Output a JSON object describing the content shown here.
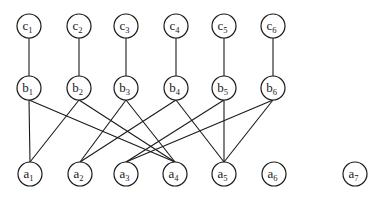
{
  "diagram": {
    "type": "layered-graph",
    "node_radius": 12,
    "colors": {
      "stroke": "#1a1a1a",
      "fill": "#ffffff",
      "background": "#ffffff"
    },
    "nodes": [
      {
        "id": "c1",
        "base": "c",
        "sub": "1",
        "x": 29,
        "y": 26
      },
      {
        "id": "c2",
        "base": "c",
        "sub": "2",
        "x": 79,
        "y": 26
      },
      {
        "id": "c3",
        "base": "c",
        "sub": "3",
        "x": 126,
        "y": 26
      },
      {
        "id": "c4",
        "base": "c",
        "sub": "4",
        "x": 176,
        "y": 26
      },
      {
        "id": "c5",
        "base": "c",
        "sub": "5",
        "x": 224,
        "y": 26
      },
      {
        "id": "c6",
        "base": "c",
        "sub": "6",
        "x": 273,
        "y": 26
      },
      {
        "id": "b1",
        "base": "b",
        "sub": "1",
        "x": 29,
        "y": 88
      },
      {
        "id": "b2",
        "base": "b",
        "sub": "2",
        "x": 79,
        "y": 88
      },
      {
        "id": "b3",
        "base": "b",
        "sub": "3",
        "x": 126,
        "y": 88
      },
      {
        "id": "b4",
        "base": "b",
        "sub": "4",
        "x": 176,
        "y": 88
      },
      {
        "id": "b5",
        "base": "b",
        "sub": "5",
        "x": 224,
        "y": 88
      },
      {
        "id": "b6",
        "base": "b",
        "sub": "6",
        "x": 273,
        "y": 88
      },
      {
        "id": "a1",
        "base": "a",
        "sub": "1",
        "x": 30,
        "y": 174
      },
      {
        "id": "a2",
        "base": "a",
        "sub": "2",
        "x": 80,
        "y": 174
      },
      {
        "id": "a3",
        "base": "a",
        "sub": "3",
        "x": 126,
        "y": 174
      },
      {
        "id": "a4",
        "base": "a",
        "sub": "4",
        "x": 175,
        "y": 174
      },
      {
        "id": "a5",
        "base": "a",
        "sub": "5",
        "x": 224,
        "y": 174
      },
      {
        "id": "a6",
        "base": "a",
        "sub": "6",
        "x": 274,
        "y": 174
      },
      {
        "id": "a7",
        "base": "a",
        "sub": "7",
        "x": 355,
        "y": 174
      }
    ],
    "edges": [
      [
        "c1",
        "b1"
      ],
      [
        "c2",
        "b2"
      ],
      [
        "c3",
        "b3"
      ],
      [
        "c4",
        "b4"
      ],
      [
        "c5",
        "b5"
      ],
      [
        "c6",
        "b6"
      ],
      [
        "b1",
        "a1"
      ],
      [
        "b1",
        "a4"
      ],
      [
        "b2",
        "a1"
      ],
      [
        "b2",
        "a4"
      ],
      [
        "b3",
        "a2"
      ],
      [
        "b3",
        "a4"
      ],
      [
        "b4",
        "a2"
      ],
      [
        "b4",
        "a5"
      ],
      [
        "b5",
        "a3"
      ],
      [
        "b5",
        "a5"
      ],
      [
        "b6",
        "a3"
      ],
      [
        "b6",
        "a5"
      ]
    ]
  }
}
